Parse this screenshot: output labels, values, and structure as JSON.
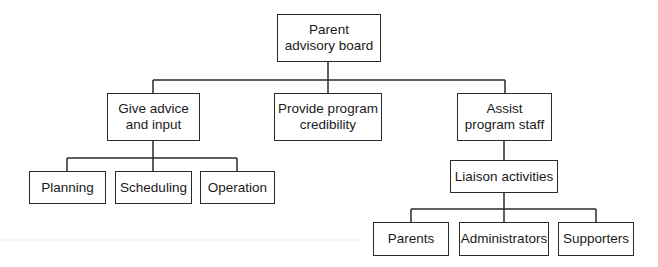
{
  "diagram": {
    "type": "org-chart",
    "root": {
      "label": "Parent\nadvisory board"
    },
    "level1": [
      {
        "label": "Give advice\nand input"
      },
      {
        "label": "Provide program\ncredibility"
      },
      {
        "label": "Assist\nprogram staff"
      }
    ],
    "advice_children": [
      {
        "label": "Planning"
      },
      {
        "label": "Scheduling"
      },
      {
        "label": "Operation"
      }
    ],
    "assist_child": {
      "label": "Liaison activities"
    },
    "liaison_children": [
      {
        "label": "Parents"
      },
      {
        "label": "Administrators"
      },
      {
        "label": "Supporters"
      }
    ],
    "line_color": "#2a2a2a"
  }
}
